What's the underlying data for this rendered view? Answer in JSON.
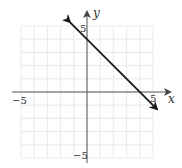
{
  "chart_data": {
    "type": "line",
    "title": "",
    "xlabel": "x",
    "ylabel": "y",
    "xlim": [
      -5,
      5
    ],
    "ylim": [
      -5,
      5
    ],
    "grid": true,
    "tick_labels": {
      "x_neg": "−5",
      "x_pos": "5",
      "y_pos": "5",
      "y_neg": "−5"
    },
    "series": [
      {
        "name": "line",
        "equation": "y = -x + 4",
        "x": [
          -1.3,
          0,
          4,
          5.3
        ],
        "y": [
          5.3,
          4,
          0,
          -1.3
        ],
        "arrows_both_ends": true,
        "color": "#1a1a1a"
      }
    ],
    "legend": null
  },
  "colors": {
    "grid": "#e4e4e4",
    "axis": "#555555",
    "line": "#1a1a1a"
  }
}
